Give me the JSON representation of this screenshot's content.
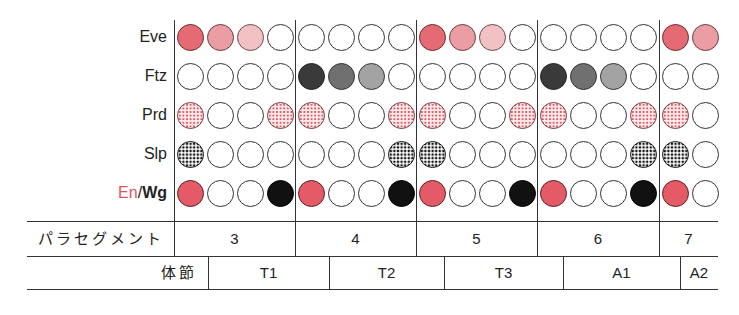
{
  "rows": [
    {
      "label": "Eve",
      "y": 37
    },
    {
      "label": "Ftz",
      "y": 76
    },
    {
      "label": "Prd",
      "y": 115
    },
    {
      "label": "Slp",
      "y": 154
    },
    {
      "label_en": "En",
      "label_sep": "/",
      "label_wg": "Wg",
      "y": 193
    }
  ],
  "legend_colors": {
    "eve_strong": "#e46a74",
    "eve_mid": "#ea9ea3",
    "eve_light": "#f2c1c4",
    "ftz_dark": "#3a3a3a",
    "ftz_mid": "#707070",
    "ftz_light": "#a3a3a3",
    "prd_dot": "#e05560",
    "slp_dot": "#111111",
    "en": "#e45a66",
    "wg": "#111111"
  },
  "parasegments": [
    {
      "label": "3",
      "x_start": 174,
      "x_end": 295,
      "cells": 4
    },
    {
      "label": "4",
      "x_start": 295,
      "x_end": 416,
      "cells": 4
    },
    {
      "label": "5",
      "x_start": 416,
      "x_end": 537,
      "cells": 4
    },
    {
      "label": "6",
      "x_start": 537,
      "x_end": 659,
      "cells": 4
    },
    {
      "label": "7",
      "x_start": 659,
      "x_end": 718,
      "cells": 2
    }
  ],
  "patterns": {
    "Eve": [
      "eve_strong",
      "eve_mid",
      "eve_light",
      "empty",
      "empty",
      "empty",
      "empty",
      "empty",
      "eve_strong",
      "eve_mid",
      "eve_light",
      "empty",
      "empty",
      "empty",
      "empty",
      "empty",
      "eve_strong",
      "eve_mid"
    ],
    "Ftz": [
      "empty",
      "empty",
      "empty",
      "empty",
      "ftz_dark",
      "ftz_mid",
      "ftz_light",
      "empty",
      "empty",
      "empty",
      "empty",
      "empty",
      "ftz_dark",
      "ftz_mid",
      "ftz_light",
      "empty",
      "empty",
      "empty"
    ],
    "Prd": [
      "prd",
      "empty",
      "empty",
      "prd",
      "prd",
      "empty",
      "empty",
      "prd",
      "prd",
      "empty",
      "empty",
      "prd",
      "prd",
      "empty",
      "empty",
      "prd",
      "prd",
      "empty"
    ],
    "Slp": [
      "slp",
      "empty",
      "empty",
      "empty",
      "empty",
      "empty",
      "empty",
      "slp",
      "slp",
      "empty",
      "empty",
      "empty",
      "empty",
      "empty",
      "empty",
      "slp",
      "slp",
      "empty"
    ],
    "EnWg": [
      "en",
      "empty",
      "empty",
      "wg",
      "en",
      "empty",
      "empty",
      "wg",
      "en",
      "empty",
      "empty",
      "wg",
      "en",
      "empty",
      "empty",
      "wg",
      "en",
      "empty"
    ]
  },
  "table": {
    "parasegment_header": "パラセグメント",
    "segment_header": "体節",
    "segments": [
      {
        "label": "T1",
        "x_start": 208,
        "x_end": 329
      },
      {
        "label": "T2",
        "x_start": 329,
        "x_end": 444
      },
      {
        "label": "T3",
        "x_start": 444,
        "x_end": 563
      },
      {
        "label": "A1",
        "x_start": 563,
        "x_end": 680
      },
      {
        "label": "A2",
        "x_start": 680,
        "x_end": 718
      }
    ]
  }
}
